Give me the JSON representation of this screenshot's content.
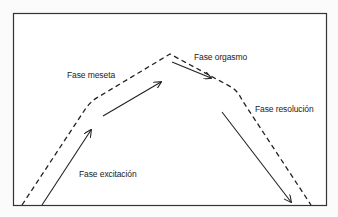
{
  "diagram": {
    "type": "sexual-response-cycle",
    "phases": [
      {
        "id": "excitation",
        "label": "Fase excitación"
      },
      {
        "id": "plateau",
        "label": "Fase meseta"
      },
      {
        "id": "orgasm",
        "label": "Fase orgasmo"
      },
      {
        "id": "resolution",
        "label": "Fase resolución"
      }
    ],
    "colors": {
      "line": "#222222",
      "background": "#fbfbfb",
      "frame": "#333333"
    }
  }
}
